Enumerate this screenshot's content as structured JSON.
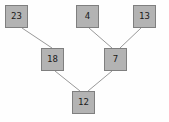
{
  "diagram": {
    "type": "tree",
    "title": "",
    "background_color": "#fefefe",
    "node_fill_color": "#b3b3b3",
    "node_border_color": "#7f7f7f",
    "edge_color": "#999999",
    "label_color": "#1a1a1a",
    "nodes": [
      {
        "id": "n23",
        "label": "23",
        "x": 5,
        "y": 5,
        "level": 0
      },
      {
        "id": "n4",
        "label": "4",
        "x": 76,
        "y": 5,
        "level": 0
      },
      {
        "id": "n13",
        "label": "13",
        "x": 133,
        "y": 5,
        "level": 0
      },
      {
        "id": "n18",
        "label": "18",
        "x": 41,
        "y": 48,
        "level": 1
      },
      {
        "id": "n7",
        "label": "7",
        "x": 104,
        "y": 48,
        "level": 1
      },
      {
        "id": "n12",
        "label": "12",
        "x": 72,
        "y": 91,
        "level": 2
      }
    ],
    "edges": [
      {
        "from": "n23",
        "to": "n18",
        "x1": 22,
        "y1": 28,
        "x2": 52,
        "y2": 48
      },
      {
        "from": "n4",
        "to": "n7",
        "x1": 89,
        "y1": 28,
        "x2": 112,
        "y2": 48
      },
      {
        "from": "n13",
        "to": "n7",
        "x1": 141,
        "y1": 28,
        "x2": 120,
        "y2": 48
      },
      {
        "from": "n18",
        "to": "n12",
        "x1": 55,
        "y1": 71,
        "x2": 80,
        "y2": 91
      },
      {
        "from": "n7",
        "to": "n12",
        "x1": 112,
        "y1": 71,
        "x2": 88,
        "y2": 91
      }
    ]
  }
}
